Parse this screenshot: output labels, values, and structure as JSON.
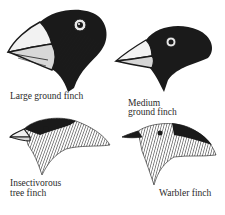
{
  "figure": {
    "finches": [
      {
        "name": "Large ground finch",
        "label_lines": [
          "Large ground finch"
        ]
      },
      {
        "name": "Medium ground finch",
        "label_lines": [
          "Medium",
          "ground finch"
        ]
      },
      {
        "name": "Insectivorous tree finch",
        "label_lines": [
          "Insectivorous",
          "tree finch"
        ]
      },
      {
        "name": "Warbler finch",
        "label_lines": [
          "Warbler finch"
        ]
      }
    ],
    "colors": {
      "ink": "#1a1a1a",
      "background": "#ffffff"
    }
  }
}
